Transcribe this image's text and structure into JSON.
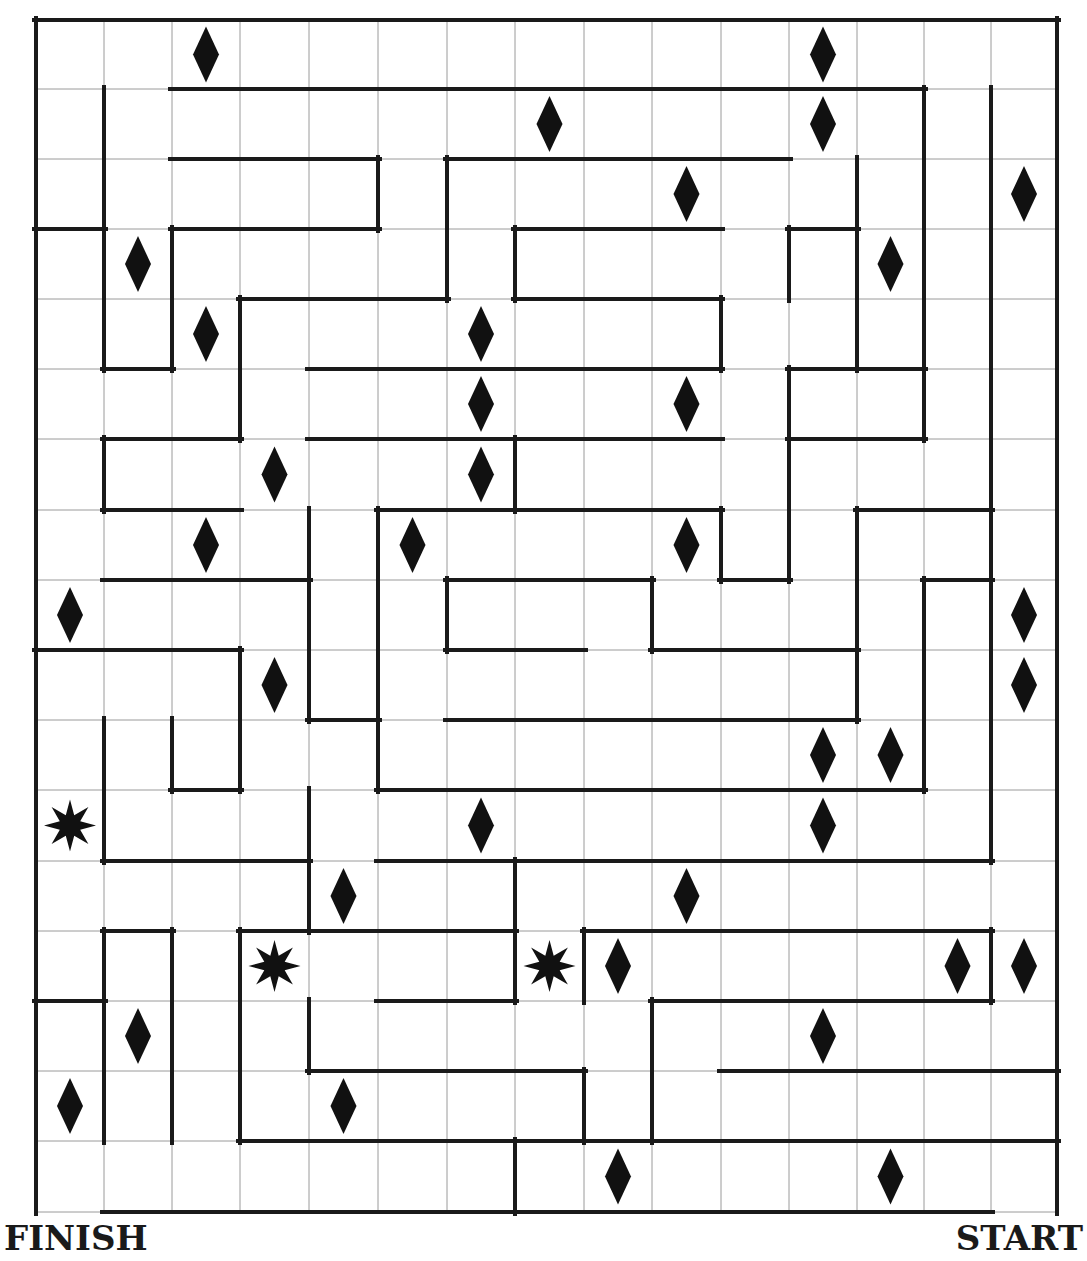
{
  "labels": {
    "finish": "FINISH",
    "start": "START"
  },
  "colors": {
    "wall": "#1a1a1a",
    "grid": "#9a9a9a",
    "background": "#ffffff",
    "marker": "#111111"
  },
  "grid": {
    "cols": 15,
    "rows": 17,
    "x_lines": [
      36,
      104,
      172,
      240,
      309,
      378,
      447,
      515,
      584,
      652,
      721,
      789,
      857,
      924,
      991,
      1057
    ],
    "y_lines": [
      20,
      89,
      159,
      229,
      299,
      369,
      439,
      510,
      580,
      650,
      720,
      790,
      861,
      931,
      1001,
      1071,
      1141,
      1212
    ]
  },
  "walls": {
    "horizontal": [
      [
        0,
        0,
        15
      ],
      [
        1,
        2,
        13
      ],
      [
        2,
        2,
        5
      ],
      [
        2,
        6,
        11
      ],
      [
        3,
        0,
        1
      ],
      [
        3,
        2,
        5
      ],
      [
        3,
        7,
        10
      ],
      [
        3,
        11,
        12
      ],
      [
        4,
        3,
        6
      ],
      [
        4,
        7,
        10
      ],
      [
        5,
        1,
        2
      ],
      [
        5,
        4,
        10
      ],
      [
        5,
        11,
        13
      ],
      [
        6,
        1,
        3
      ],
      [
        6,
        4,
        10
      ],
      [
        6,
        11,
        13
      ],
      [
        7,
        1,
        3
      ],
      [
        7,
        5,
        10
      ],
      [
        7,
        12,
        14
      ],
      [
        8,
        1,
        4
      ],
      [
        8,
        6,
        9
      ],
      [
        8,
        10,
        11
      ],
      [
        8,
        13,
        14
      ],
      [
        9,
        0,
        3
      ],
      [
        9,
        6,
        8
      ],
      [
        9,
        9,
        12
      ],
      [
        10,
        4,
        5
      ],
      [
        10,
        6,
        12
      ],
      [
        11,
        2,
        3
      ],
      [
        11,
        5,
        13
      ],
      [
        12,
        1,
        4
      ],
      [
        12,
        5,
        14
      ],
      [
        13,
        1,
        2
      ],
      [
        13,
        3,
        7
      ],
      [
        13,
        8,
        14
      ],
      [
        14,
        0,
        1
      ],
      [
        14,
        5,
        7
      ],
      [
        14,
        9,
        14
      ],
      [
        15,
        4,
        8
      ],
      [
        15,
        10,
        15
      ],
      [
        16,
        3,
        8
      ],
      [
        16,
        8,
        15
      ],
      [
        17,
        1,
        14
      ]
    ],
    "vertical": [
      [
        0,
        0,
        17
      ],
      [
        1,
        1,
        5
      ],
      [
        1,
        6,
        7
      ],
      [
        1,
        10,
        12
      ],
      [
        1,
        13,
        16
      ],
      [
        2,
        3,
        5
      ],
      [
        2,
        10,
        11
      ],
      [
        2,
        13,
        16
      ],
      [
        3,
        4,
        6
      ],
      [
        3,
        9,
        11
      ],
      [
        3,
        13,
        16
      ],
      [
        4,
        7,
        10
      ],
      [
        4,
        11,
        13
      ],
      [
        4,
        14,
        15
      ],
      [
        5,
        2,
        3
      ],
      [
        5,
        7,
        11
      ],
      [
        6,
        2,
        4
      ],
      [
        6,
        8,
        9
      ],
      [
        7,
        3,
        4
      ],
      [
        7,
        6,
        7
      ],
      [
        7,
        12,
        14
      ],
      [
        7,
        16,
        17
      ],
      [
        8,
        13,
        14
      ],
      [
        8,
        15,
        16
      ],
      [
        9,
        8,
        9
      ],
      [
        9,
        14,
        16
      ],
      [
        10,
        4,
        5
      ],
      [
        10,
        7,
        8
      ],
      [
        11,
        3,
        4
      ],
      [
        11,
        5,
        8
      ],
      [
        12,
        2,
        5
      ],
      [
        12,
        7,
        10
      ],
      [
        13,
        1,
        6
      ],
      [
        13,
        8,
        11
      ],
      [
        14,
        1,
        12
      ],
      [
        14,
        13,
        14
      ],
      [
        15,
        0,
        17
      ]
    ]
  },
  "markers": [
    {
      "type": "diamond",
      "col": 2,
      "row": 0
    },
    {
      "type": "diamond",
      "col": 11,
      "row": 0
    },
    {
      "type": "diamond",
      "col": 7,
      "row": 1
    },
    {
      "type": "diamond",
      "col": 11,
      "row": 1
    },
    {
      "type": "diamond",
      "col": 9,
      "row": 2
    },
    {
      "type": "diamond",
      "col": 14,
      "row": 2
    },
    {
      "type": "diamond",
      "col": 1,
      "row": 3
    },
    {
      "type": "diamond",
      "col": 12,
      "row": 3
    },
    {
      "type": "diamond",
      "col": 2,
      "row": 4
    },
    {
      "type": "diamond",
      "col": 6,
      "row": 4
    },
    {
      "type": "diamond",
      "col": 6,
      "row": 5
    },
    {
      "type": "diamond",
      "col": 9,
      "row": 5
    },
    {
      "type": "diamond",
      "col": 3,
      "row": 6
    },
    {
      "type": "diamond",
      "col": 6,
      "row": 6
    },
    {
      "type": "diamond",
      "col": 2,
      "row": 7
    },
    {
      "type": "diamond",
      "col": 5,
      "row": 7
    },
    {
      "type": "diamond",
      "col": 9,
      "row": 7
    },
    {
      "type": "diamond",
      "col": 0,
      "row": 8
    },
    {
      "type": "diamond",
      "col": 14,
      "row": 8
    },
    {
      "type": "diamond",
      "col": 3,
      "row": 9
    },
    {
      "type": "diamond",
      "col": 14,
      "row": 9
    },
    {
      "type": "diamond",
      "col": 11,
      "row": 10
    },
    {
      "type": "diamond",
      "col": 12,
      "row": 10
    },
    {
      "type": "star",
      "col": 0,
      "row": 11
    },
    {
      "type": "diamond",
      "col": 6,
      "row": 11
    },
    {
      "type": "diamond",
      "col": 11,
      "row": 11
    },
    {
      "type": "diamond",
      "col": 4,
      "row": 12
    },
    {
      "type": "diamond",
      "col": 9,
      "row": 12
    },
    {
      "type": "star",
      "col": 3,
      "row": 13
    },
    {
      "type": "star",
      "col": 7,
      "row": 13
    },
    {
      "type": "diamond",
      "col": 8,
      "row": 13
    },
    {
      "type": "diamond",
      "col": 13,
      "row": 13
    },
    {
      "type": "diamond",
      "col": 14,
      "row": 13
    },
    {
      "type": "diamond",
      "col": 1,
      "row": 14
    },
    {
      "type": "diamond",
      "col": 11,
      "row": 14
    },
    {
      "type": "diamond",
      "col": 0,
      "row": 15
    },
    {
      "type": "diamond",
      "col": 4,
      "row": 15
    },
    {
      "type": "diamond",
      "col": 8,
      "row": 16
    },
    {
      "type": "diamond",
      "col": 12,
      "row": 16
    }
  ]
}
